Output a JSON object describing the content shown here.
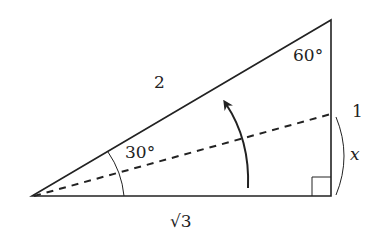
{
  "diagram": {
    "type": "right-triangle",
    "labels": {
      "hypotenuse": "2",
      "top_angle": "60°",
      "bottom_angle": "30°",
      "vertical_side": "1",
      "base": "√3",
      "segment_variable": "x"
    },
    "colors": {
      "stroke": "#222222",
      "background": "#ffffff"
    }
  }
}
